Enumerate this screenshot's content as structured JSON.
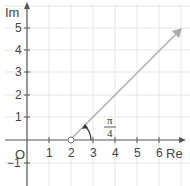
{
  "diagram": {
    "axes": {
      "x_label": "Re",
      "y_label": "Im",
      "origin_label": "O",
      "x_ticks": [
        "1",
        "2",
        "3",
        "4",
        "5",
        "6"
      ],
      "y_ticks": [
        "5",
        "4",
        "3",
        "2",
        "1",
        "−1"
      ]
    },
    "ray": {
      "start": [
        2,
        0
      ],
      "start_marker": "open-circle",
      "angle_label_num": "π",
      "angle_label_den": "4",
      "direction": "pi/4"
    },
    "colors": {
      "grid": "#e4e4e4",
      "axis": "#555555",
      "ray": "#aaaaaa"
    }
  }
}
